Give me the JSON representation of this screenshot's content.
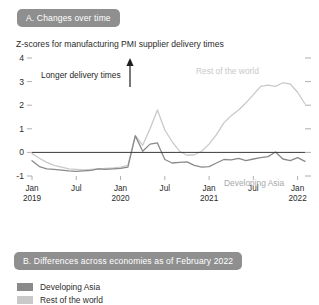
{
  "panel_a": {
    "badge_label": "A. Changes over time",
    "subtitle": "Z-scores for manufacturing PMI supplier delivery times",
    "annotation": "Longer delivery times",
    "annotation_icon": "up-arrow-icon",
    "series_label_rest": "Rest of the world",
    "series_label_asia": "Developing Asia"
  },
  "panel_b": {
    "badge_label": "B. Differences across economies as of February 2022",
    "legend": [
      {
        "label": "Developing Asia",
        "color": "#8a8a8a",
        "icon": "legend-swatch-icon"
      },
      {
        "label": "Rest of the world",
        "color": "#c9c9c9",
        "icon": "legend-swatch-icon"
      }
    ]
  },
  "colors": {
    "badge_bg": "#8f8f8f",
    "badge_text": "#ffffff",
    "developing_asia": "#8a8a8a",
    "rest_of_world": "#c9c9c9",
    "zero_line": "#3a3a3a",
    "tick": "#9a9a9a"
  },
  "chart_data": {
    "type": "line",
    "title": "Z-scores for manufacturing PMI supplier delivery times",
    "xlabel": "",
    "ylabel": "",
    "ylim": [
      -1,
      4
    ],
    "yticks": [
      4,
      3,
      2,
      1,
      0,
      -1
    ],
    "ytick_labels": [
      "4",
      "3",
      "2",
      "1",
      "0",
      "-1"
    ],
    "grid": false,
    "legend_position": "inline-annotation",
    "zero_reference_line": 0,
    "x_tick_positions": [
      0,
      6,
      12,
      18,
      24,
      30,
      36
    ],
    "xtick_labels": [
      {
        "month": "Jan",
        "year": "2019"
      },
      {
        "month": "Jul",
        "year": ""
      },
      {
        "month": "Jan",
        "year": "2020"
      },
      {
        "month": "Jul",
        "year": ""
      },
      {
        "month": "Jan",
        "year": "2021"
      },
      {
        "month": "Jul",
        "year": ""
      },
      {
        "month": "Jan",
        "year": "2022"
      }
    ],
    "x": [
      "2019-01",
      "2019-02",
      "2019-03",
      "2019-04",
      "2019-05",
      "2019-06",
      "2019-07",
      "2019-08",
      "2019-09",
      "2019-10",
      "2019-11",
      "2019-12",
      "2020-01",
      "2020-02",
      "2020-03",
      "2020-04",
      "2020-05",
      "2020-06",
      "2020-07",
      "2020-08",
      "2020-09",
      "2020-10",
      "2020-11",
      "2020-12",
      "2021-01",
      "2021-02",
      "2021-03",
      "2021-04",
      "2021-05",
      "2021-06",
      "2021-07",
      "2021-08",
      "2021-09",
      "2021-10",
      "2021-11",
      "2021-12",
      "2022-01",
      "2022-02"
    ],
    "series": [
      {
        "name": "Rest of the world",
        "color": "#c9c9c9",
        "values": [
          -0.05,
          -0.25,
          -0.42,
          -0.55,
          -0.62,
          -0.7,
          -0.72,
          -0.74,
          -0.72,
          -0.7,
          -0.68,
          -0.66,
          -0.62,
          -0.55,
          0.72,
          0.3,
          1.0,
          1.8,
          0.95,
          0.45,
          0.05,
          -0.12,
          -0.1,
          0.05,
          0.35,
          0.75,
          1.25,
          1.55,
          1.8,
          2.1,
          2.45,
          2.8,
          2.85,
          2.8,
          2.95,
          2.9,
          2.55,
          2.05
        ]
      },
      {
        "name": "Developing Asia",
        "color": "#8a8a8a",
        "values": [
          -0.35,
          -0.6,
          -0.7,
          -0.72,
          -0.75,
          -0.78,
          -0.8,
          -0.78,
          -0.76,
          -0.7,
          -0.72,
          -0.7,
          -0.68,
          -0.62,
          0.7,
          0.05,
          0.35,
          0.4,
          -0.3,
          -0.45,
          -0.42,
          -0.4,
          -0.55,
          -0.62,
          -0.6,
          -0.45,
          -0.3,
          -0.32,
          -0.25,
          -0.35,
          -0.28,
          -0.22,
          -0.18,
          0.02,
          -0.28,
          -0.35,
          -0.22,
          -0.38
        ]
      }
    ]
  }
}
